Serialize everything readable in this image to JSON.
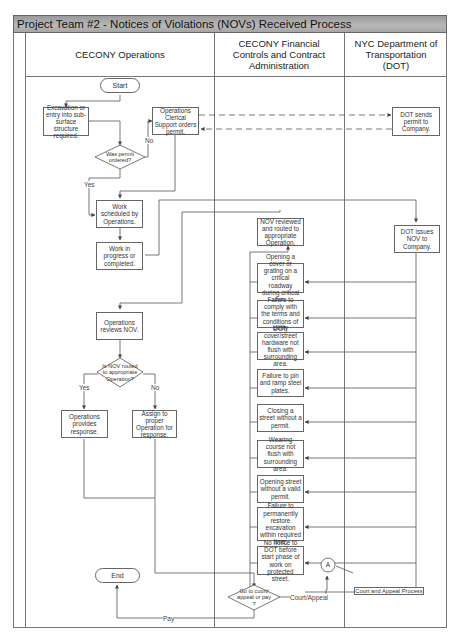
{
  "title": "Project Team #2 - Notices of Violations (NOVs) Received Process",
  "lanes": [
    {
      "label": "CECONY Operations"
    },
    {
      "label": "CECONY Financial Controls and Contract Administration"
    },
    {
      "label": "NYC Department of Transportation (DOT)"
    }
  ],
  "nodes": {
    "start": "Start",
    "excavation": "Excavation or entry into sub-surface structure required.",
    "permit_decision": "Was permit ordered?",
    "ops_clerical": "Operations Clerical Support orders permit.",
    "dot_sends_permit": "DOT sends permit to Company.",
    "work_scheduled": "Work scheduled by Operations.",
    "work_in_progress": "Work in progress or completed.",
    "nov_reviewed": "NOV reviewed and routed to appropriate Operation.",
    "dot_issues_nov": "DOT issues NOV to Company.",
    "ops_reviews_nov": "Operations reviews NOV.",
    "routed_decision": "Is NOV routed to appropriate Operation?",
    "ops_provides_response": "Operations provides response.",
    "assign_proper": "Assign to proper Operation for response.",
    "end": "End",
    "court_decision": "Go to court/ appeal or pay ?",
    "connector_a": "A",
    "court_appeal_process": "Court and Appeal Process"
  },
  "violations": [
    "Opening a cover or grating on a critical roadway during critical hrs.",
    "Failure to comply with the terms and conditions of DOT.",
    "Utility cover/street hardware not flush with surrounding area.",
    "Failure to pin and ramp steel plates.",
    "Closing a street without a permit.",
    "Wearing course not flush with surrounding area.",
    "Opening street without a valid permit.",
    "Failure to permanently restore excavation within required time.",
    "No notice to DOT before start phase of work on protected street."
  ],
  "edge_labels": {
    "no_1": "No",
    "yes_1": "Yes",
    "yes_2": "Yes",
    "no_2": "No",
    "court_appeal": "Court/Appeal",
    "pay": "Pay"
  }
}
